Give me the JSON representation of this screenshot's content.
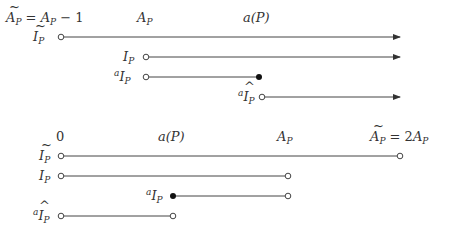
{
  "top_diagram": {
    "axis_labels": [
      {
        "text": "Ã_P = A_P − 1",
        "x": 6,
        "y": 22
      },
      {
        "text": "A_P",
        "x": 137,
        "y": 22
      },
      {
        "text": "a(P)",
        "x": 243,
        "y": 22
      }
    ],
    "rows": [
      {
        "label": "Ĩ_P",
        "y": 37,
        "start_x": 61,
        "start": "open",
        "end_x": 400,
        "end": "arrow"
      },
      {
        "label": "I_P",
        "y": 57,
        "start_x": 146,
        "start": "open",
        "end_x": 400,
        "end": "arrow"
      },
      {
        "label": "ᵃI_P",
        "y": 77,
        "start_x": 146,
        "start": "open",
        "end_x": 259,
        "end": "filled"
      },
      {
        "label": "ᵃÎ_P",
        "y": 97,
        "start_x": 262,
        "start": "open",
        "end_x": 400,
        "end": "arrow"
      }
    ]
  },
  "bottom_diagram": {
    "axis_labels": [
      {
        "text": "0",
        "x": 56,
        "y": 141
      },
      {
        "text": "a(P)",
        "x": 158,
        "y": 141
      },
      {
        "text": "A_P",
        "x": 277,
        "y": 141
      },
      {
        "text": "Ã_P = 2A_P",
        "x": 370,
        "y": 141
      }
    ],
    "rows": [
      {
        "label": "Ĩ_P",
        "y": 156,
        "start_x": 61,
        "start": "open",
        "end_x": 400,
        "end": "open"
      },
      {
        "label": "I_P",
        "y": 176,
        "start_x": 61,
        "start": "open",
        "end_x": 288,
        "end": "open"
      },
      {
        "label": "ᵃI_P",
        "y": 196,
        "start_x": 173,
        "start": "filled",
        "end_x": 288,
        "end": "open"
      },
      {
        "label": "ᵃÎ_P",
        "y": 216,
        "start_x": 61,
        "start": "open",
        "end_x": 173,
        "end": "open"
      }
    ]
  }
}
